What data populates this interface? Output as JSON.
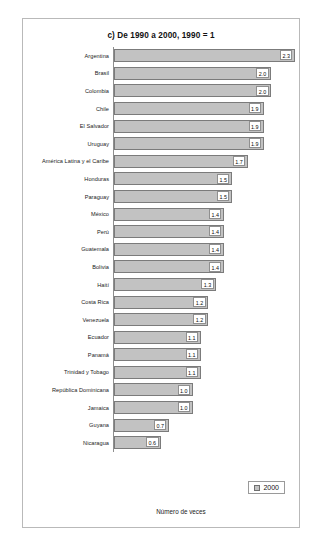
{
  "chart_data": {
    "type": "bar",
    "orientation": "horizontal",
    "title": "c) De 1990 a 2000, 1990 = 1",
    "xlabel": "Número de veces",
    "ylabel": "",
    "xlim": [
      0,
      2.35
    ],
    "grid": false,
    "legend": {
      "position": "bottom-right",
      "entries": [
        "2000"
      ]
    },
    "series": [
      {
        "name": "2000",
        "color": "#c2c2c2"
      }
    ],
    "categories": [
      "Argentina",
      "Brasil",
      "Colombia",
      "Chile",
      "El Salvador",
      "Uruguay",
      "América Latina y el Caribe",
      "Honduras",
      "Paraguay",
      "México",
      "Perú",
      "Guatemala",
      "Bolivia",
      "Haití",
      "Costa Rica",
      "Venezuela",
      "Ecuador",
      "Panamá",
      "Trinidad y Tobago",
      "República Dominicana",
      "Jamaica",
      "Guyana",
      "Nicaragua"
    ],
    "values": [
      2.3,
      2.0,
      2.0,
      1.9,
      1.9,
      1.9,
      1.7,
      1.5,
      1.5,
      1.4,
      1.4,
      1.4,
      1.4,
      1.3,
      1.2,
      1.2,
      1.1,
      1.1,
      1.1,
      1.0,
      1.0,
      0.7,
      0.6
    ],
    "value_labels": [
      "2.3",
      "2.0",
      "2.0",
      "1.9",
      "1.9",
      "1.9",
      "1.7",
      "1.5",
      "1.5",
      "1.4",
      "1.4",
      "1.4",
      "1.4",
      "1.3",
      "1.2",
      "1.2",
      "1.1",
      "1.1",
      "1.1",
      "1.0",
      "1.0",
      "0.7",
      "0.6"
    ]
  },
  "colors": {
    "bar_fill": "#c2c2c2",
    "bar_border": "#7b7b7b",
    "frame": "#b9b9b9",
    "text": "#1a1a1a"
  }
}
